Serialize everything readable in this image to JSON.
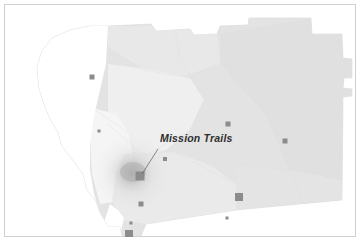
{
  "figure": {
    "kind": "choropleth-density-map",
    "region_name": "San Diego County",
    "background_color": "#ffffff",
    "frame_color": "#cfcfcf"
  },
  "map": {
    "base_fill": "#e3e3e3",
    "base_stroke": "#dadada",
    "water_fill": "#ffffff",
    "light_zone_fill": "#f2f2f2",
    "mid_zone_fill": "#ececec",
    "density_peak_color": "#a9a9a9",
    "density_mid_color": "#c6c6c6",
    "marker_color": "#8c8c8c",
    "leader_line_color": "#6b6b6b",
    "outline_points": "104,22 147,20 152,27 186,25 190,31 213,30 216,22 244,21 245,14 307,14 308,30 338,30 339,54 348,55 348,74 340,74 339,84 348,85 348,92 339,93 338,196 232,206 142,220 137,232 118,232 116,222 104,222 96,209 92,197 83,186 79,170 68,155 58,142 54,128 46,115 40,100 35,84 33,63 38,47 48,34 66,26 86,22",
    "coast_points": "104,222 96,209 92,197 83,186 79,170 68,155 58,142 54,128 46,115 40,100 35,84 33,63 38,47 48,34 66,26 86,22 104,22 104,60 98,80 92,104 88,124 86,146 88,168 92,186 96,200 98,214"
  },
  "zones": [
    {
      "name": "north-inland-zone",
      "fill": "#e8e8e8",
      "points": "104,22 190,22 213,30 216,60 180,72 140,66 118,52 104,44"
    },
    {
      "name": "northeast-zone",
      "fill": "#e0e0e0",
      "points": "216,30 307,14 308,30 338,30 339,54 348,55 348,92 339,93 338,196 300,200 262,110 230,76 216,58"
    },
    {
      "name": "central-valley-zone",
      "fill": "#efefef",
      "points": "104,60 150,66 186,74 200,96 186,126 162,146 140,152 120,144 104,120"
    },
    {
      "name": "coastal-strip-zone",
      "fill": "#f6f6f6",
      "points": "88,104 112,110 126,130 130,156 124,180 110,198 96,200 88,170 86,136"
    },
    {
      "name": "south-zone",
      "fill": "#eaeaea",
      "points": "120,150 170,148 208,162 232,180 232,206 142,220 118,216 108,196 112,170"
    },
    {
      "name": "southeast-zone",
      "fill": "#e4e4e4",
      "points": "232,160 300,168 338,176 338,196 232,206"
    }
  ],
  "density_hotspot": {
    "name": "central-density-peak",
    "cx": 128,
    "cy": 169,
    "radius": 34
  },
  "markers": [
    {
      "name": "marker-north-coastal",
      "x": 88,
      "y": 73,
      "size": 5
    },
    {
      "name": "marker-coastal-small",
      "x": 95,
      "y": 127,
      "size": 3
    },
    {
      "name": "marker-mission-trails",
      "x": 136,
      "y": 172,
      "size": 9
    },
    {
      "name": "marker-inland-small",
      "x": 161,
      "y": 155,
      "size": 4
    },
    {
      "name": "marker-north-inland",
      "x": 224,
      "y": 120,
      "size": 5
    },
    {
      "name": "marker-east",
      "x": 281,
      "y": 137,
      "size": 5
    },
    {
      "name": "marker-southeast-large",
      "x": 235,
      "y": 193,
      "size": 8
    },
    {
      "name": "marker-south-small",
      "x": 223,
      "y": 214,
      "size": 3
    },
    {
      "name": "marker-south-valley",
      "x": 137,
      "y": 200,
      "size": 5
    },
    {
      "name": "marker-border-tiny",
      "x": 127,
      "y": 219,
      "size": 3
    },
    {
      "name": "marker-border-large",
      "x": 125,
      "y": 230,
      "size": 8
    }
  ],
  "annotation": {
    "label": "Mission Trails",
    "label_x": 156,
    "label_y": 133,
    "leader_from_x": 154,
    "leader_from_y": 145,
    "leader_to_x": 138,
    "leader_to_y": 170
  }
}
